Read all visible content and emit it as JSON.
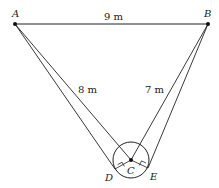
{
  "diagram": {
    "points": {
      "A": {
        "label": "A",
        "x": 15,
        "y": 24
      },
      "B": {
        "label": "B",
        "x": 208,
        "y": 24
      },
      "C": {
        "label": "C",
        "x": 131,
        "y": 160
      },
      "D": {
        "label": "D",
        "x": 115,
        "y": 169
      },
      "E": {
        "label": "E",
        "x": 148,
        "y": 168
      }
    },
    "circle": {
      "center": "C",
      "radius": 18
    },
    "measurements": {
      "AB": "9 m",
      "AC": "8 m",
      "BC": "7 m"
    },
    "right_angle_marks": [
      "D",
      "E"
    ],
    "colors": {
      "stroke": "#222222",
      "background": "#ffffff"
    }
  }
}
